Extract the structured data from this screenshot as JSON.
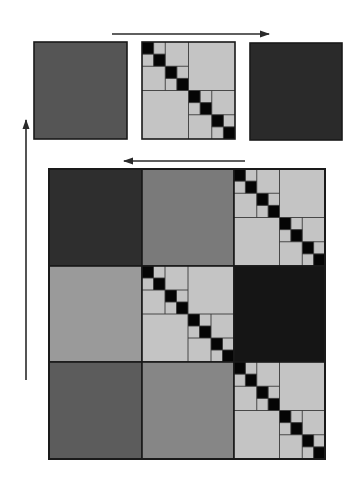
{
  "canvas": {
    "width": 352,
    "height": 479,
    "background": "#ffffff"
  },
  "colors": {
    "stroke": "#1a1a1a",
    "grid_line": "#3a3a3a",
    "identity_fill": "#c4c4c4",
    "identity_diag": "#050505",
    "arrow": "#2a2a2a"
  },
  "arrows": [
    {
      "name": "top-right-arrow",
      "x1": 112,
      "y1": 34,
      "x2": 269,
      "y2": 34,
      "direction": "right"
    },
    {
      "name": "middle-left-arrow",
      "x1": 245,
      "y1": 161,
      "x2": 124,
      "y2": 161,
      "direction": "left"
    },
    {
      "name": "left-up-arrow",
      "x1": 26,
      "y1": 380,
      "x2": 26,
      "y2": 120,
      "direction": "up"
    }
  ],
  "top_row": [
    {
      "name": "top-block-left",
      "type": "solid",
      "x": 34,
      "y": 42,
      "w": 93,
      "h": 97,
      "fill": "#555555"
    },
    {
      "name": "top-block-middle",
      "type": "hierarchical-identity",
      "x": 142,
      "y": 42,
      "w": 93,
      "h": 97,
      "n": 8
    },
    {
      "name": "top-block-right",
      "type": "solid",
      "x": 250,
      "y": 43,
      "w": 92,
      "h": 97,
      "fill": "#2a2a2a"
    }
  ],
  "large_matrix": {
    "x": 49,
    "y": 169,
    "w": 276,
    "h": 290,
    "col_edges": [
      49,
      142,
      234,
      325
    ],
    "row_edges": [
      169,
      266,
      362,
      459
    ],
    "blocks": [
      [
        {
          "type": "solid",
          "fill": "#2e2e2e"
        },
        {
          "type": "solid",
          "fill": "#7a7a7a"
        },
        {
          "type": "hierarchical-identity",
          "n": 8
        }
      ],
      [
        {
          "type": "solid",
          "fill": "#9a9a9a"
        },
        {
          "type": "hierarchical-identity",
          "n": 8
        },
        {
          "type": "solid",
          "fill": "#151515"
        }
      ],
      [
        {
          "type": "solid",
          "fill": "#5c5c5c"
        },
        {
          "type": "solid",
          "fill": "#868686"
        },
        {
          "type": "hierarchical-identity",
          "n": 8
        }
      ]
    ]
  }
}
